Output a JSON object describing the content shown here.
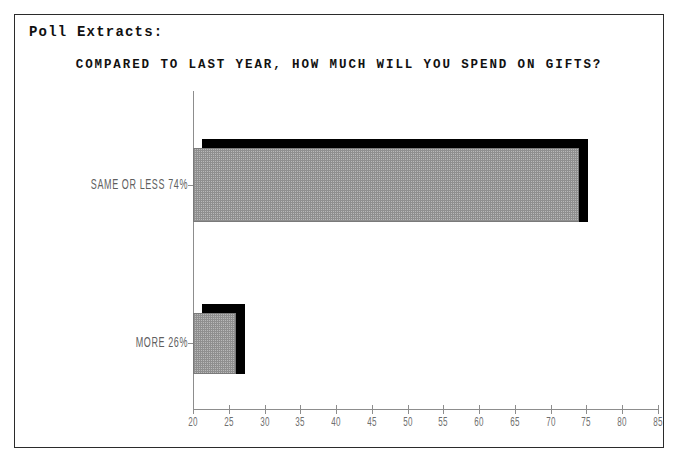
{
  "frame": {
    "section_label": "Poll Extracts:"
  },
  "chart_data": {
    "type": "bar",
    "orientation": "horizontal",
    "title": "COMPARED TO LAST YEAR, HOW MUCH WILL YOU SPEND ON GIFTS?",
    "xlabel": "",
    "ylabel": "",
    "categories": [
      "SAME OR LESS",
      "MORE"
    ],
    "values": [
      74,
      26
    ],
    "value_unit": "%",
    "category_labels": [
      "SAME OR LESS 74%",
      "MORE 26%"
    ],
    "xlim": [
      20,
      85
    ],
    "xticks": [
      20,
      25,
      30,
      35,
      40,
      45,
      50,
      55,
      60,
      65,
      70,
      75,
      80,
      85
    ],
    "xtick_labels": [
      "20",
      "25",
      "30",
      "35",
      "40",
      "45",
      "50",
      "55",
      "60",
      "65",
      "70",
      "75",
      "80",
      "85"
    ],
    "grid": false,
    "legend": false,
    "style": "3d-shadow-bar",
    "colors": {
      "bar_fill": "#b9b9b9",
      "bar_shadow": "#000000",
      "axis": "#8d8d8d",
      "text": "#111111",
      "tick_text": "#6f6f6f",
      "frame_border": "#2b2b2b",
      "background": "#ffffff"
    }
  }
}
